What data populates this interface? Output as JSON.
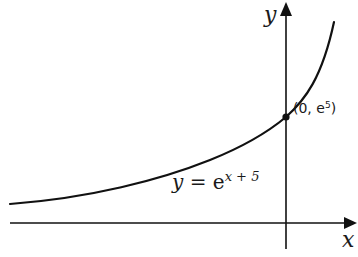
{
  "diagram": {
    "type": "function-graph",
    "axes": {
      "x_label": "x",
      "y_label": "y"
    },
    "curve": {
      "equation_lhs": "y",
      "equation_eq": " = ",
      "equation_base": "e",
      "equation_exp": "x + 5"
    },
    "point": {
      "label_prefix": "(0, e",
      "label_exp": "5",
      "label_suffix": ")"
    },
    "colors": {
      "stroke": "#111111",
      "text": "#1a1a1a"
    }
  }
}
